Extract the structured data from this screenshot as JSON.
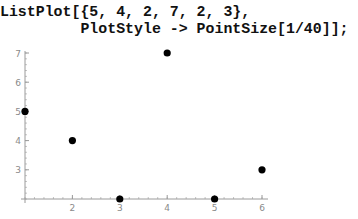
{
  "code": {
    "lines": [
      "ListPlot[{5, 4, 2, 7, 2, 3},",
      "         PlotStyle -> PointSize[1/40]];"
    ]
  },
  "colors": {
    "axis": "#9a9a9a",
    "point": "#000000",
    "tick_label": "#8a8a8a",
    "code_text": "#111111"
  },
  "chart_data": {
    "type": "scatter",
    "title": "",
    "xlabel": "",
    "ylabel": "",
    "x": [
      1,
      2,
      3,
      4,
      5,
      6
    ],
    "values": [
      5,
      4,
      2,
      7,
      2,
      3
    ],
    "series": [
      {
        "name": "ListPlot data",
        "x": [
          1,
          2,
          3,
          4,
          5,
          6
        ],
        "values": [
          5,
          4,
          2,
          7,
          2,
          3
        ]
      }
    ],
    "x_ticks": [
      "2",
      "3",
      "4",
      "5",
      "6"
    ],
    "y_ticks": [
      "3",
      "4",
      "5",
      "6",
      "7"
    ],
    "xlim": [
      1,
      6
    ],
    "ylim": [
      2,
      7
    ],
    "axes_origin": [
      1,
      2
    ],
    "grid": false,
    "legend": "none",
    "point_size": "1/40"
  }
}
